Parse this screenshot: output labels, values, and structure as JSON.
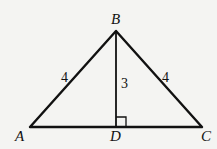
{
  "diagram": {
    "type": "triangle",
    "vertices": {
      "A": {
        "label": "A",
        "x": 30,
        "y": 127
      },
      "B": {
        "label": "B",
        "x": 116,
        "y": 31
      },
      "C": {
        "label": "C",
        "x": 202,
        "y": 127
      },
      "D": {
        "label": "D",
        "x": 116,
        "y": 127
      }
    },
    "segments": [
      {
        "from": "A",
        "to": "B",
        "length_label": "4"
      },
      {
        "from": "B",
        "to": "C",
        "length_label": "4"
      },
      {
        "from": "B",
        "to": "D",
        "length_label": "3"
      },
      {
        "from": "A",
        "to": "C",
        "length_label": ""
      }
    ],
    "right_angle_at": "D",
    "labels": {
      "a": "A",
      "b": "B",
      "c": "C",
      "d": "D",
      "ab": "4",
      "bc": "4",
      "bd": "3"
    }
  }
}
